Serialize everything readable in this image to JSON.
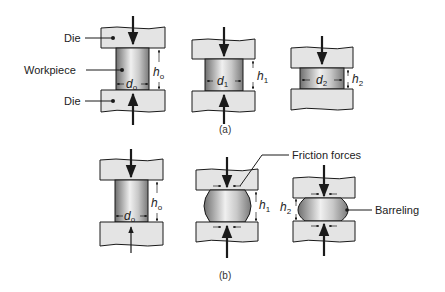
{
  "figure": {
    "labels": {
      "die_top": "Die",
      "workpiece": "Workpiece",
      "die_bottom": "Die",
      "friction_forces": "Friction forces",
      "barreling": "Barreling"
    },
    "captions": {
      "a": "(a)",
      "b": "(b)"
    },
    "variables": {
      "h0": "h",
      "h0_sub": "o",
      "d0": "d",
      "d0_sub": "o",
      "h1": "h",
      "h1_sub": "1",
      "d1": "d",
      "d1_sub": "1",
      "h2": "h",
      "h2_sub": "2",
      "d2": "d",
      "d2_sub": "2"
    },
    "colors": {
      "die_fill": "#e4e4e4",
      "workpiece_dark": "#7a7a7a",
      "workpiece_light": "#f2f2f2",
      "outline": "#1a1a1a"
    }
  }
}
